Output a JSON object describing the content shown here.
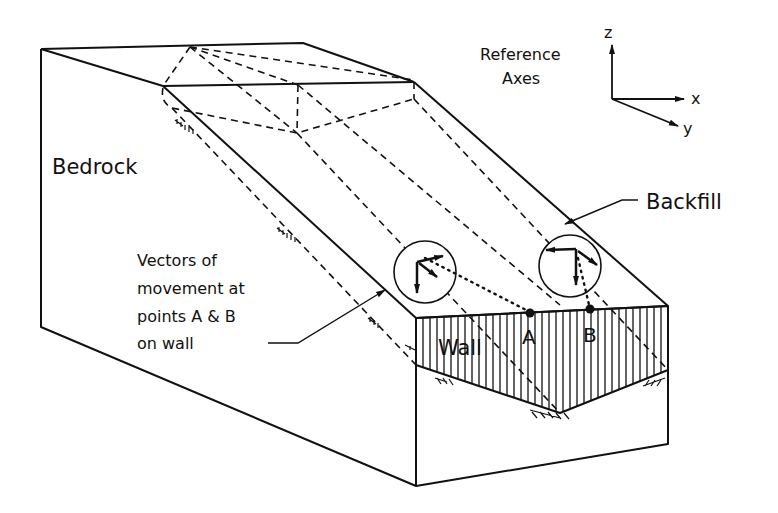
{
  "labels": {
    "bedrock": "Bedrock",
    "backfill": "Backfill",
    "wall": "Wall",
    "point_a": "A",
    "point_b": "B",
    "reference_axes_line1": "Reference",
    "reference_axes_line2": "Axes",
    "vectors_line1": "Vectors of",
    "vectors_line2": "movement at",
    "vectors_line3": "points A & B",
    "vectors_line4": "on wall"
  },
  "axes": {
    "x": "x",
    "y": "y",
    "z": "z"
  },
  "colors": {
    "ink": "#111111",
    "background": "#ffffff"
  }
}
